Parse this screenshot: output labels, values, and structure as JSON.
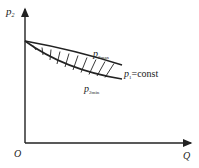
{
  "diagram": {
    "type": "pressure-flow characteristic",
    "y_axis": {
      "label": "p",
      "subscript": "2"
    },
    "x_axis": {
      "label": "Q"
    },
    "origin_label": "O",
    "curves": [
      {
        "name": "upper",
        "label": "p",
        "subscript": "2max"
      },
      {
        "name": "lower",
        "label": "p",
        "subscript": "2min"
      }
    ],
    "condition": {
      "label": "p",
      "subscript": "1",
      "suffix": "=const"
    },
    "shaded_region": "hatched area between p2max and p2min",
    "colors": {
      "line": "#222222",
      "background": "#ffffff"
    }
  }
}
